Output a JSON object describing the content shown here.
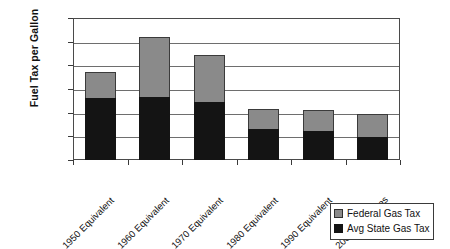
{
  "chart_data": {
    "type": "bar",
    "subtype": "stacked-bar",
    "title": "",
    "xlabel": "",
    "ylabel": "Fuel Tax per Gallon",
    "ylim": [
      0.0,
      1.2
    ],
    "ytick_step": 0.2,
    "ytick_labels": [
      "$1.20",
      "$1.00",
      "$0.80",
      "$0.60",
      "$0.40",
      "$0.20",
      "$0.00"
    ],
    "ytick_values": [
      1.2,
      1.0,
      0.8,
      0.6,
      0.4,
      0.2,
      0.0
    ],
    "grid": true,
    "grid_axis": "y",
    "legend_position": "bottom-right",
    "categories": [
      "1950 Equivalent",
      "1960 Equivalent",
      "1970 Equivalent",
      "1980 Equivalent",
      "1990 Equivalent",
      "2000 Fuel Taxes"
    ],
    "series": [
      {
        "name": "Avg State Gas Tax",
        "color": "#141414",
        "values": [
          0.52,
          0.53,
          0.49,
          0.26,
          0.245,
          0.195
        ]
      },
      {
        "name": "Federal Gas Tax",
        "color": "#8a8a8a",
        "values": [
          0.22,
          0.51,
          0.4,
          0.17,
          0.18,
          0.19
        ]
      }
    ],
    "stack_order_bottom_to_top": [
      "Avg State Gas Tax",
      "Federal Gas Tax"
    ],
    "totals": [
      0.74,
      1.04,
      0.89,
      0.43,
      0.425,
      0.385
    ]
  },
  "legend": {
    "entries": [
      {
        "label": "Federal Gas Tax",
        "color": "#8a8a8a"
      },
      {
        "label": "Avg State Gas Tax",
        "color": "#141414"
      }
    ]
  }
}
